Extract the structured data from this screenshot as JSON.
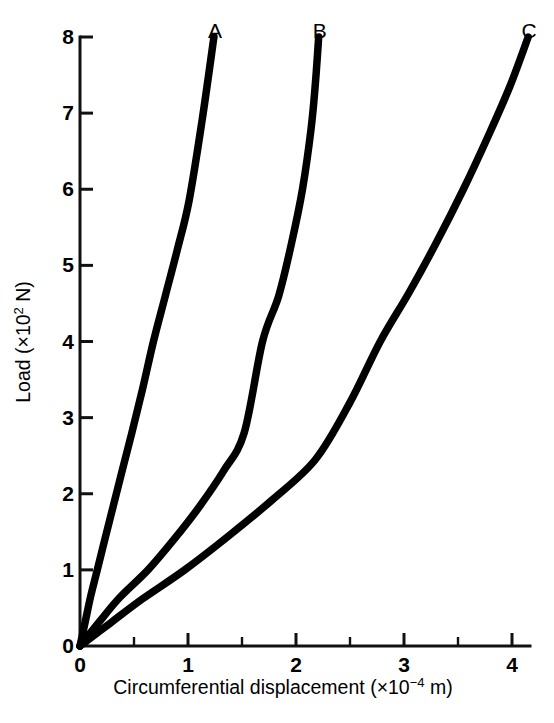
{
  "chart_data": {
    "type": "line",
    "title": "",
    "xlabel": "Circumferential displacement (×10⁻⁴ m)",
    "xlabel_parts": {
      "text_before": "Circumferential displacement (×10",
      "exponent": "−4",
      "text_after": " m)"
    },
    "ylabel": "Load (×10² N)",
    "ylabel_parts": {
      "text_before": "Load (×10",
      "exponent": "2",
      "text_after": " N)"
    },
    "xlim": [
      0,
      4.2
    ],
    "ylim": [
      0,
      8
    ],
    "xticks": [
      0,
      1,
      2,
      3,
      4
    ],
    "xtick_labels": [
      "0",
      "1",
      "2",
      "3",
      "4"
    ],
    "xticks_minor": [
      0.5,
      1.5,
      2.5,
      3.5
    ],
    "yticks": [
      0,
      1,
      2,
      3,
      4,
      5,
      6,
      7,
      8
    ],
    "ytick_labels": [
      "0",
      "1",
      "2",
      "3",
      "4",
      "5",
      "6",
      "7",
      "8"
    ],
    "grid": false,
    "legend_position": "curve-end-labels",
    "annotations": [
      {
        "label": "A",
        "x": 1.24,
        "y": 8.35
      },
      {
        "label": "B",
        "x": 2.21,
        "y": 8.35
      },
      {
        "label": "C",
        "x": 4.15,
        "y": 8.35
      }
    ],
    "series": [
      {
        "name": "A",
        "label": "A",
        "color": "#000000",
        "x": [
          0.0,
          0.05,
          0.1,
          0.16,
          0.23,
          0.31,
          0.39,
          0.48,
          0.58,
          0.68,
          0.79,
          0.9,
          1.01,
          1.13,
          1.24
        ],
        "y": [
          0.0,
          0.33,
          0.66,
          1.0,
          1.4,
          1.85,
          2.3,
          2.8,
          3.38,
          4.0,
          4.6,
          5.2,
          5.85,
          6.9,
          8.0
        ]
      },
      {
        "name": "B",
        "label": "B",
        "color": "#000000",
        "x": [
          0.0,
          0.18,
          0.37,
          0.63,
          0.87,
          1.1,
          1.33,
          1.52,
          1.69,
          1.84,
          1.96,
          2.06,
          2.14,
          2.18,
          2.21
        ],
        "y": [
          0.0,
          0.32,
          0.64,
          1.0,
          1.4,
          1.82,
          2.3,
          2.8,
          4.0,
          4.6,
          5.3,
          6.0,
          6.8,
          7.4,
          8.0
        ]
      },
      {
        "name": "C",
        "label": "C",
        "color": "#000000",
        "x": [
          0.0,
          0.28,
          0.58,
          0.97,
          1.38,
          1.78,
          2.18,
          2.5,
          2.78,
          3.05,
          3.3,
          3.55,
          3.78,
          3.98,
          4.15
        ],
        "y": [
          0.0,
          0.3,
          0.62,
          1.0,
          1.45,
          1.92,
          2.45,
          3.2,
          4.0,
          4.65,
          5.3,
          6.0,
          6.7,
          7.35,
          8.0
        ]
      }
    ]
  },
  "axes": {
    "y_axis_name": "load-axis",
    "x_axis_name": "displacement-axis"
  }
}
